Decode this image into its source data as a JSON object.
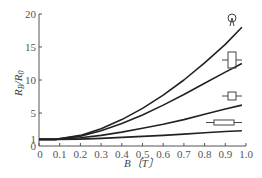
{
  "chart_data": {
    "type": "line",
    "title": "",
    "xlabel": "B (T)",
    "ylabel": "R_B / R_0",
    "xlim": [
      0,
      1.0
    ],
    "ylim": [
      0,
      20
    ],
    "grid": false,
    "legend_position": "none (shape icons at right end of each curve)",
    "x_ticks": [
      "0",
      "0.1",
      "0.2",
      "0.3",
      "0.4",
      "0.5",
      "0.6",
      "0.7",
      "0.8",
      "0.9",
      "1.0"
    ],
    "y_ticks": [
      "0",
      "1",
      "5",
      "10",
      "15",
      "20"
    ],
    "x": [
      0,
      0.08,
      0.2,
      0.3,
      0.4,
      0.5,
      0.6,
      0.7,
      0.8,
      0.9,
      0.98
    ],
    "series": [
      {
        "name": "circular (Corbino disk)",
        "icon": "circle-disk-icon",
        "values": [
          1,
          1,
          1.6,
          2.6,
          4.0,
          5.7,
          7.7,
          10.0,
          12.6,
          15.4,
          18.0
        ]
      },
      {
        "name": "square-tall rectangle",
        "icon": "tall-rectangle-icon",
        "values": [
          1,
          1,
          1.5,
          2.3,
          3.4,
          4.7,
          6.2,
          7.8,
          9.5,
          11.2,
          12.5
        ]
      },
      {
        "name": "square",
        "icon": "square-icon",
        "values": [
          1,
          1,
          1.25,
          1.6,
          2.1,
          2.7,
          3.3,
          4.0,
          4.8,
          5.6,
          6.2
        ]
      },
      {
        "name": "long thin rectangle",
        "icon": "long-rectangle-icon",
        "values": [
          1,
          1,
          1.05,
          1.15,
          1.3,
          1.45,
          1.6,
          1.8,
          2.0,
          2.2,
          2.3
        ]
      }
    ]
  },
  "labels": {
    "x_axis_title": "B〔T〕",
    "y_axis_title": "R",
    "y_axis_sub1": "B",
    "y_axis_slash": "/R",
    "y_axis_sub2": "0"
  }
}
